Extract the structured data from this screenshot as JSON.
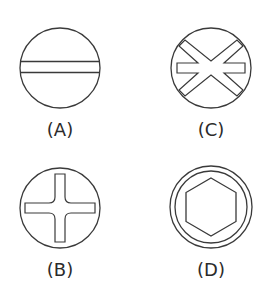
{
  "diagram": {
    "stroke_color": "#3a3a3a",
    "items": [
      {
        "id": "A",
        "label": "(A)",
        "icon": "slotted-screw-head-icon"
      },
      {
        "id": "B",
        "label": "(B)",
        "icon": "phillips-screw-head-icon"
      },
      {
        "id": "C",
        "label": "(C)",
        "icon": "frearson-star-screw-head-icon"
      },
      {
        "id": "D",
        "label": "(D)",
        "icon": "hex-socket-screw-head-icon"
      }
    ]
  }
}
